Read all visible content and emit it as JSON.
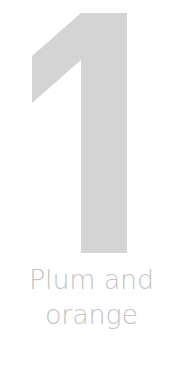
{
  "numeral": {
    "value": "1",
    "color": "#d4d4d4"
  },
  "caption": {
    "line1": "Plum and",
    "line2": "orange",
    "color": "#c4c4c4"
  }
}
